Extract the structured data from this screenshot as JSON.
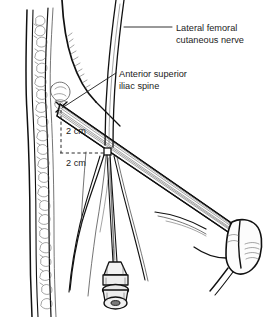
{
  "figure": {
    "width": 275,
    "height": 317,
    "background_color": "#ffffff",
    "ink_color": "#111111",
    "text_color": "#1c1c1c"
  },
  "labels": {
    "nerve": {
      "line1": "Lateral femoral",
      "line2": "cutaneous nerve",
      "x": 176,
      "y_line1": 31,
      "y_line2": 43
    },
    "asis": {
      "line1": "Anterior superior",
      "line2": "iliac spine",
      "x": 119,
      "y_line1": 77,
      "y_line2": 89
    },
    "measure_vertical": {
      "text": "2 cm",
      "x": 66,
      "y": 134
    },
    "measure_horizontal": {
      "text": "2 cm",
      "x": 66,
      "y": 166
    }
  },
  "anatomy": {
    "parts": [
      {
        "name": "abdominal-wall-skin-layer",
        "description": "skin and subcutaneous fat cross-section at left margin"
      },
      {
        "name": "subcutaneous-fat-lobules",
        "description": "stippled fat lobule texture"
      },
      {
        "name": "thigh-contour",
        "description": "lateral thigh outline"
      },
      {
        "name": "anterior-superior-iliac-spine",
        "description": "bony landmark marked with an X"
      },
      {
        "name": "inguinal-ligament",
        "description": "fibrous band running from ASIS to pubic tubercle"
      },
      {
        "name": "lateral-femoral-cutaneous-nerve",
        "description": "nerve descending under the inguinal ligament"
      },
      {
        "name": "nerve-branches",
        "description": "fanning distal nerve branches in the thigh"
      },
      {
        "name": "pubic-bone",
        "description": "pubic tubercle and bone at lower right"
      },
      {
        "name": "block-needle",
        "description": "needle inserted 2 cm medial and 2 cm inferior to the ASIS"
      },
      {
        "name": "needle-hub",
        "description": "luer connector hub at needle base"
      }
    ]
  },
  "markers": {
    "asis_point": {
      "x": 61,
      "y": 107
    },
    "needle_entry": {
      "x": 107,
      "y": 152
    }
  }
}
